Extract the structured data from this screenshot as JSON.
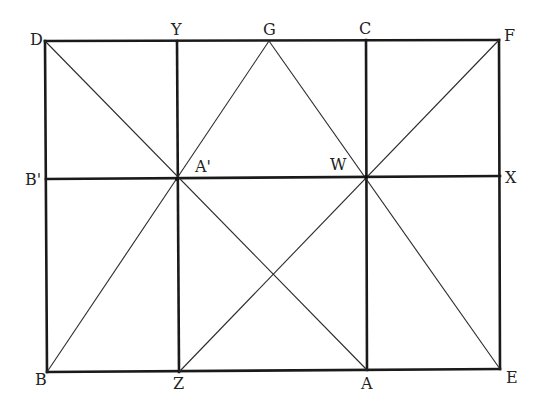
{
  "diagram": {
    "title": "",
    "points": {
      "D": {
        "x": 45,
        "y": 41
      },
      "Y": {
        "x": 177,
        "y": 41
      },
      "G": {
        "x": 269,
        "y": 41
      },
      "C": {
        "x": 366,
        "y": 40
      },
      "F": {
        "x": 499,
        "y": 40
      },
      "B_prime": {
        "x": 46,
        "y": 179
      },
      "A_prime": {
        "x": 177,
        "y": 179
      },
      "W": {
        "x": 366,
        "y": 177
      },
      "X": {
        "x": 500,
        "y": 176
      },
      "B": {
        "x": 47,
        "y": 372
      },
      "Z": {
        "x": 179,
        "y": 372
      },
      "A": {
        "x": 367,
        "y": 370
      },
      "E": {
        "x": 500,
        "y": 369
      }
    },
    "labels": {
      "D": "D",
      "Y": "Y",
      "G": "G",
      "C": "C",
      "F": "F",
      "B_prime": "B'",
      "A_prime": "A'",
      "W": "W",
      "X": "X",
      "B": "B",
      "Z": "Z",
      "A": "A",
      "E": "E"
    },
    "thick_segments": [
      [
        "D",
        "F"
      ],
      [
        "F",
        "E"
      ],
      [
        "E",
        "B"
      ],
      [
        "B",
        "D"
      ],
      [
        "Y",
        "Z"
      ],
      [
        "C",
        "A"
      ],
      [
        "B_prime",
        "X"
      ]
    ],
    "thin_segments": [
      [
        "D",
        "A"
      ],
      [
        "B",
        "G"
      ],
      [
        "G",
        "E"
      ],
      [
        "Z",
        "F"
      ]
    ]
  }
}
